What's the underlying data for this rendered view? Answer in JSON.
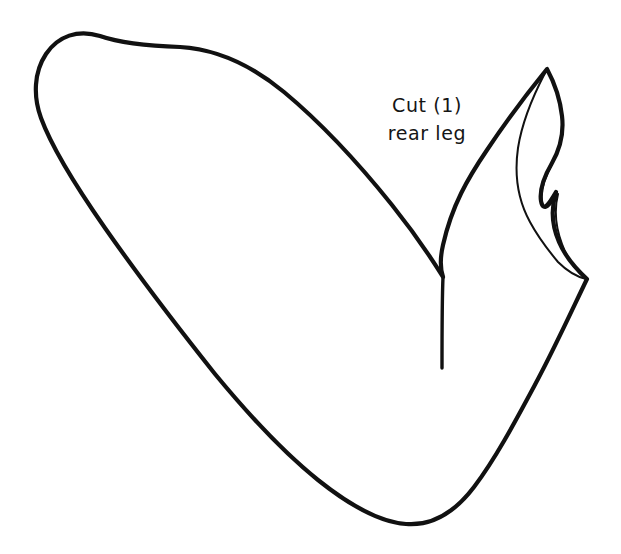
{
  "canvas": {
    "width": 621,
    "height": 554,
    "background_color": "#ffffff"
  },
  "drawing": {
    "title": "rear leg pattern piece",
    "kind": "line-art-pattern-template",
    "stroke_color": "#111111",
    "fill_color": "none",
    "outer_stroke_width": 4.2,
    "inner_stroke_width": 2.0,
    "slit_stroke_width": 3.4
  },
  "annotation": {
    "line1": "Cut (1)",
    "line2": "rear leg",
    "color": "#151515",
    "font_size_px": 19,
    "center_x": 427,
    "line1_baseline_y": 117,
    "line2_baseline_y": 148
  },
  "geometry": {
    "outer_outline_path": "M 547 69 C 525 96 505 123 487 150 C 468 178 452 205 443 245 C 440 258 440 268 443 277 C 430 256 412 230 392 205 C 360 165 320 122 284 92 C 250 64 215 49 180 47 C 150 46 120 43 100 36 C 78 29 58 36 46 54 C 34 72 33 96 41 118 C 52 148 75 185 105 228 C 140 278 180 330 215 374 C 248 414 283 452 318 480 C 348 504 378 522 406 524 C 432 526 455 512 474 487 C 496 458 516 420 538 379 C 556 345 572 310 587 279 C 575 268 565 256 559 242 C 552 226 551 208 556 192 C 549 204 543 213 541 201 C 539 188 545 175 552 163 C 560 149 564 133 562 116 C 560 98 554 82 547 69 Z",
    "inner_detail_path": "M 545 73 C 532 98 522 122 518 148 C 514 176 519 202 530 222 C 538 237 548 250 558 262 C 568 272 578 277 586 279 C 575 270 567 258 562 244 C 556 228 554 210 558 194 C 550 206 544 214 542 202 C 540 189 546 176 552 164",
    "slit_path": "M 443 277 C 442 300 442 330 442 368"
  }
}
